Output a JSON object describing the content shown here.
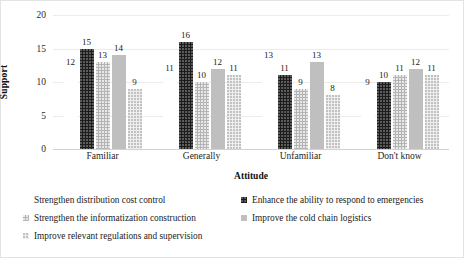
{
  "chart_data": {
    "type": "bar",
    "title": "",
    "xlabel": "Attitude",
    "ylabel": "Support",
    "categories": [
      "Familiar",
      "Generally",
      "Unfamiliar",
      "Don't know"
    ],
    "ylim": [
      0,
      20
    ],
    "yticks": [
      0,
      5,
      10,
      15,
      20
    ],
    "grid": true,
    "legend_position": "bottom",
    "series": [
      {
        "name": "Strengthen distribution cost control",
        "color": "#ffffff",
        "values": [
          12,
          11,
          13,
          9
        ]
      },
      {
        "name": "Enhance the ability to respond to emergencies",
        "color": "#1c1c1c",
        "values": [
          15,
          16,
          11,
          10
        ]
      },
      {
        "name": "Strengthen the informatization construction",
        "color": "#b4b4b4",
        "values": [
          13,
          10,
          9,
          11
        ]
      },
      {
        "name": "Improve the cold chain logistics",
        "color": "#bfbfbf",
        "values": [
          14,
          12,
          13,
          12
        ]
      },
      {
        "name": "Improve relevant regulations and supervision",
        "color": "#eeeeee",
        "values": [
          9,
          11,
          8,
          11
        ]
      }
    ]
  },
  "axes": {
    "y_title": "Support",
    "x_title": "Attitude",
    "y_tick_labels": [
      "20",
      "15",
      "10",
      "5",
      "0"
    ],
    "x_tick_labels": [
      "Familiar",
      "Generally",
      "Unfamiliar",
      "Don't know"
    ]
  },
  "legend": {
    "entries": [
      {
        "label": "Strengthen distribution cost control",
        "swatch": "#ffffff",
        "series_index": 0
      },
      {
        "label": "Enhance the ability to respond to emergencies",
        "swatch": "#1c1c1c",
        "series_index": 1
      },
      {
        "label": "Strengthen the informatization construction",
        "swatch": "#b4b4b4",
        "series_index": 2
      },
      {
        "label": "Improve the cold chain logistics",
        "swatch": "#bfbfbf",
        "series_index": 3
      },
      {
        "label": "Improve relevant regulations and supervision",
        "swatch": "#eeeeee",
        "series_index": 4
      }
    ]
  },
  "data_labels": {
    "Familiar": [
      "12",
      "15",
      "13",
      "14",
      "9"
    ],
    "Generally": [
      "11",
      "16",
      "10",
      "12",
      "11"
    ],
    "Unfamiliar": [
      "13",
      "11",
      "9",
      "13",
      "8"
    ],
    "Dont_know": [
      "9",
      "10",
      "11",
      "12",
      "11"
    ]
  }
}
